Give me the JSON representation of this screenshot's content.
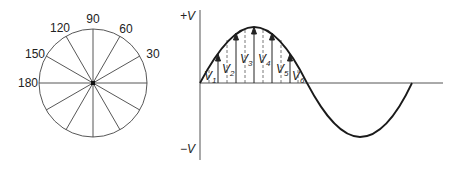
{
  "phasor_circle": {
    "angle_labels": [
      "90",
      "60",
      "30",
      "120",
      "150",
      "180"
    ],
    "spoke_count": 12
  },
  "sine_wave": {
    "y_axis_top_label": "+V",
    "y_axis_bottom_label": "−V",
    "instant_labels": [
      "V",
      "V",
      "V",
      "V",
      "V",
      "V"
    ],
    "instant_subscripts": [
      "1",
      "2",
      "3",
      "4",
      "5",
      "6"
    ]
  },
  "colors": {
    "line": "#222222",
    "axis": "#555555",
    "background": "#ffffff"
  }
}
